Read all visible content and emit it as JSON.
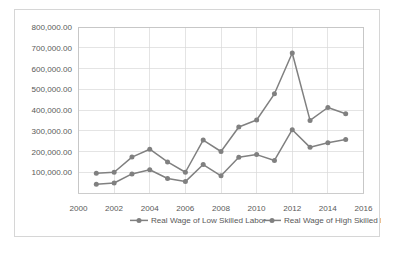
{
  "chart_data": {
    "type": "line",
    "title": "",
    "xlabel": "",
    "ylabel": "",
    "grid": true,
    "legend_position": "bottom",
    "x": [
      2001,
      2002,
      2003,
      2004,
      2005,
      2006,
      2007,
      2008,
      2009,
      2010,
      2011,
      2012,
      2013,
      2014,
      2015
    ],
    "xlim": [
      2000,
      2016
    ],
    "ylim": [
      0,
      800000
    ],
    "xticks": [
      2000,
      2002,
      2004,
      2006,
      2008,
      2010,
      2012,
      2014,
      2016
    ],
    "xtick_labels": [
      "2000",
      "2002",
      "2004",
      "2006",
      "2008",
      "2010",
      "2012",
      "2014",
      "2016"
    ],
    "yticks": [
      100000,
      200000,
      300000,
      400000,
      500000,
      600000,
      700000,
      800000
    ],
    "ytick_labels": [
      "100,000.00",
      "200,000.00",
      "300,000.00",
      "400,000.00",
      "500,000.00",
      "600,000.00",
      "700,000.00",
      "800,000.00"
    ],
    "series": [
      {
        "name": "Real Wage of Low Skilled Labor",
        "color": "#808080",
        "values": [
          42000,
          48000,
          92000,
          112000,
          70000,
          55000,
          137000,
          83000,
          172000,
          185000,
          157000,
          305000,
          220000,
          242000,
          258000
        ]
      },
      {
        "name": "Real Wage of High Skilled Labor",
        "color": "#808080",
        "values": [
          95000,
          100000,
          173000,
          211000,
          150000,
          100000,
          255000,
          200000,
          318000,
          352000,
          478000,
          675000,
          350000,
          412000,
          382000
        ]
      }
    ]
  },
  "legend": {
    "items": [
      {
        "label": "Real Wage of Low Skilled Labor"
      },
      {
        "label": "Real Wage of High Skilled Labor"
      }
    ]
  },
  "colors": {
    "series": "#808080",
    "gridline": "#d9d9d9",
    "frame": "#bfbfbf",
    "text": "#595959",
    "background": "#ffffff"
  }
}
